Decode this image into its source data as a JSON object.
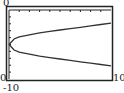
{
  "chart_data": {
    "type": "line",
    "title": "",
    "xlabel": "",
    "ylabel": "",
    "xlim": [
      0,
      10
    ],
    "ylim": [
      -10,
      0
    ],
    "x_tick_scale": 1,
    "y_tick_scale": 1,
    "grid": false,
    "labels": {
      "ymax": "0",
      "xmin": "0",
      "ymin": "-10",
      "xmax": "10"
    },
    "series": [
      {
        "name": "upper-branch",
        "x": [
          0,
          0.5,
          1,
          2,
          3,
          4,
          5,
          6,
          7,
          8,
          9,
          10
        ],
        "y": [
          -5,
          -4.2,
          -3.9,
          -3.6,
          -3.3,
          -3.1,
          -2.9,
          -2.7,
          -2.5,
          -2.3,
          -2.1,
          -1.9
        ]
      },
      {
        "name": "lower-branch",
        "x": [
          0,
          0.5,
          1,
          2,
          3,
          4,
          5,
          6,
          7,
          8,
          9,
          10
        ],
        "y": [
          -5,
          -5.8,
          -6.1,
          -6.4,
          -6.7,
          -6.9,
          -7.1,
          -7.3,
          -7.5,
          -7.7,
          -7.9,
          -8.1
        ]
      }
    ],
    "colors": {
      "frame": "#222222",
      "curve": "#333333",
      "background": "#ffffff"
    }
  }
}
